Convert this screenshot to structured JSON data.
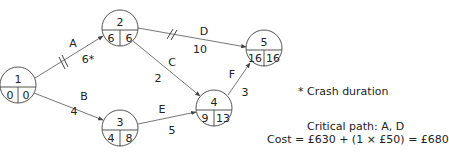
{
  "diagram": {
    "type": "activity-on-arrow network",
    "nodes": [
      {
        "id": "1",
        "earliest": "0",
        "latest": "0"
      },
      {
        "id": "2",
        "earliest": "6",
        "latest": "6"
      },
      {
        "id": "3",
        "earliest": "4",
        "latest": "8"
      },
      {
        "id": "4",
        "earliest": "9",
        "latest": "13"
      },
      {
        "id": "5",
        "earliest": "16",
        "latest": "16"
      }
    ],
    "edges": [
      {
        "activity": "A",
        "from": "1",
        "to": "2",
        "duration": "6*",
        "critical": true
      },
      {
        "activity": "B",
        "from": "1",
        "to": "3",
        "duration": "4",
        "critical": false
      },
      {
        "activity": "C",
        "from": "2",
        "to": "4",
        "duration": "2",
        "critical": false
      },
      {
        "activity": "D",
        "from": "2",
        "to": "5",
        "duration": "10",
        "critical": true
      },
      {
        "activity": "E",
        "from": "3",
        "to": "4",
        "duration": "5",
        "critical": false
      },
      {
        "activity": "F",
        "from": "4",
        "to": "5",
        "duration": "3",
        "critical": false
      }
    ]
  },
  "notes": {
    "footnote": "* Crash duration",
    "critical_path": "Critical path: A, D",
    "cost": "Cost = £630 + (1 × £50) = £680"
  }
}
